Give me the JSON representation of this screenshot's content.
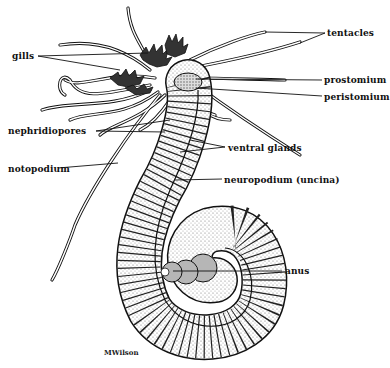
{
  "figure": {
    "signature": "MWilson",
    "labels": {
      "tentacles": "tentacles",
      "gills": "gills",
      "prostomium": "prostomium",
      "peristomium": "peristomium",
      "nephridiopores": "nephridiopores",
      "ventral_glands": "ventral glands",
      "notopodium": "notopodium",
      "neuropodium": "neuropodium (uncina)",
      "anus": "anus"
    },
    "colors": {
      "ink": "#111111",
      "background": "#ffffff",
      "stipple": "#9a9a9a"
    }
  }
}
